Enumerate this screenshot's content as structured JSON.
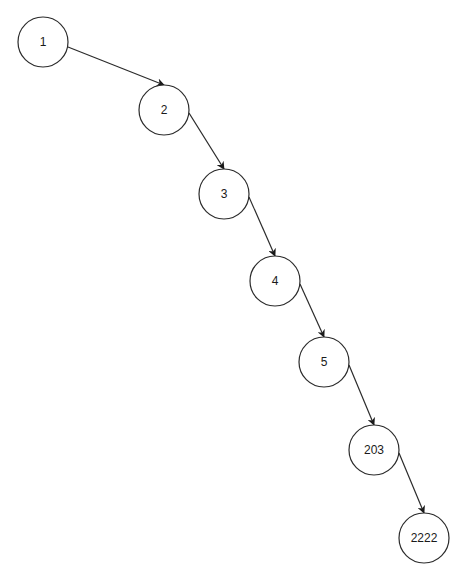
{
  "diagram": {
    "type": "linked-list-tree",
    "colors": {
      "background": "#ffffff",
      "stroke": "#2b2b2b",
      "text": "#1a1a1a"
    },
    "node_radius": 25,
    "nodes": [
      {
        "id": "n1",
        "label": "1",
        "cx": 43,
        "cy": 42
      },
      {
        "id": "n2",
        "label": "2",
        "cx": 164,
        "cy": 110
      },
      {
        "id": "n3",
        "label": "3",
        "cx": 224,
        "cy": 194
      },
      {
        "id": "n4",
        "label": "4",
        "cx": 275,
        "cy": 281
      },
      {
        "id": "n5",
        "label": "5",
        "cx": 324,
        "cy": 362
      },
      {
        "id": "n203",
        "label": "203",
        "cx": 374,
        "cy": 450
      },
      {
        "id": "n2222",
        "label": "2222",
        "cx": 424,
        "cy": 538
      }
    ],
    "edges": [
      {
        "from": "1",
        "to": "2",
        "x1": 68,
        "y1": 47,
        "x2": 164,
        "y2": 85
      },
      {
        "from": "2",
        "to": "3",
        "x1": 189,
        "y1": 113,
        "x2": 224,
        "y2": 169
      },
      {
        "from": "3",
        "to": "4",
        "x1": 249,
        "y1": 197,
        "x2": 275,
        "y2": 256
      },
      {
        "from": "4",
        "to": "5",
        "x1": 300,
        "y1": 284,
        "x2": 324,
        "y2": 337
      },
      {
        "from": "5",
        "to": "203",
        "x1": 349,
        "y1": 365,
        "x2": 374,
        "y2": 425
      },
      {
        "from": "203",
        "to": "2222",
        "x1": 399,
        "y1": 453,
        "x2": 424,
        "y2": 513
      }
    ]
  }
}
